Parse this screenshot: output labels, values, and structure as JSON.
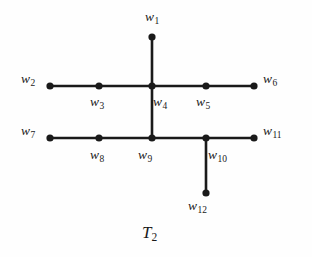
{
  "figure": {
    "caption_base": "T",
    "caption_sub": "2",
    "caption_full": "T2",
    "background_color": "#fefefe",
    "stroke_color": "#1a1a1a",
    "node_fill_color": "#1a1a1a",
    "edge_width_px": 2.6,
    "node_radius_px": 3.6,
    "caption_x": 142,
    "caption_y": 224
  },
  "chart_data": {
    "type": "diagram",
    "title": "T2",
    "node_count": 12,
    "edge_count": 11,
    "nodes": [
      {
        "id": "w1",
        "base": "w",
        "sub": "1",
        "label": "w1",
        "x": 152,
        "y": 37,
        "label_x": 145,
        "label_y": 10,
        "degree": 1
      },
      {
        "id": "w2",
        "base": "w",
        "sub": "2",
        "label": "w2",
        "x": 50,
        "y": 86,
        "label_x": 21,
        "label_y": 72,
        "degree": 1
      },
      {
        "id": "w3",
        "base": "w",
        "sub": "3",
        "label": "w3",
        "x": 99,
        "y": 86,
        "label_x": 90,
        "label_y": 95,
        "degree": 2
      },
      {
        "id": "w4",
        "base": "w",
        "sub": "4",
        "label": "w4",
        "x": 152,
        "y": 86,
        "label_x": 153,
        "label_y": 95,
        "degree": 4
      },
      {
        "id": "w5",
        "base": "w",
        "sub": "5",
        "label": "w5",
        "x": 206,
        "y": 86,
        "label_x": 196,
        "label_y": 95,
        "degree": 2
      },
      {
        "id": "w6",
        "base": "w",
        "sub": "6",
        "label": "w6",
        "x": 254,
        "y": 86,
        "label_x": 263,
        "label_y": 72,
        "degree": 1
      },
      {
        "id": "w7",
        "base": "w",
        "sub": "7",
        "label": "w7",
        "x": 50,
        "y": 138,
        "label_x": 21,
        "label_y": 124,
        "degree": 1
      },
      {
        "id": "w8",
        "base": "w",
        "sub": "8",
        "label": "w8",
        "x": 99,
        "y": 138,
        "label_x": 90,
        "label_y": 148,
        "degree": 2
      },
      {
        "id": "w9",
        "base": "w",
        "sub": "9",
        "label": "w9",
        "x": 152,
        "y": 138,
        "label_x": 138,
        "label_y": 148,
        "degree": 3
      },
      {
        "id": "w10",
        "base": "w",
        "sub": "10",
        "label": "w10",
        "x": 206,
        "y": 138,
        "label_x": 208,
        "label_y": 148,
        "degree": 3
      },
      {
        "id": "w11",
        "base": "w",
        "sub": "11",
        "label": "w11",
        "x": 254,
        "y": 138,
        "label_x": 263,
        "label_y": 124,
        "degree": 1
      },
      {
        "id": "w12",
        "base": "w",
        "sub": "12",
        "label": "w12",
        "x": 206,
        "y": 193,
        "label_x": 188,
        "label_y": 199,
        "degree": 1
      }
    ],
    "edges": [
      {
        "from": "w1",
        "to": "w4",
        "x1": 152,
        "y1": 37,
        "x2": 152,
        "y2": 86,
        "orientation": "vertical"
      },
      {
        "from": "w2",
        "to": "w3",
        "x1": 50,
        "y1": 86,
        "x2": 99,
        "y2": 86,
        "orientation": "horizontal"
      },
      {
        "from": "w3",
        "to": "w4",
        "x1": 99,
        "y1": 86,
        "x2": 152,
        "y2": 86,
        "orientation": "horizontal"
      },
      {
        "from": "w4",
        "to": "w5",
        "x1": 152,
        "y1": 86,
        "x2": 206,
        "y2": 86,
        "orientation": "horizontal"
      },
      {
        "from": "w5",
        "to": "w6",
        "x1": 206,
        "y1": 86,
        "x2": 254,
        "y2": 86,
        "orientation": "horizontal"
      },
      {
        "from": "w4",
        "to": "w9",
        "x1": 152,
        "y1": 86,
        "x2": 152,
        "y2": 138,
        "orientation": "vertical"
      },
      {
        "from": "w7",
        "to": "w8",
        "x1": 50,
        "y1": 138,
        "x2": 99,
        "y2": 138,
        "orientation": "horizontal"
      },
      {
        "from": "w8",
        "to": "w9",
        "x1": 99,
        "y1": 138,
        "x2": 152,
        "y2": 138,
        "orientation": "horizontal"
      },
      {
        "from": "w9",
        "to": "w10",
        "x1": 152,
        "y1": 138,
        "x2": 206,
        "y2": 138,
        "orientation": "horizontal"
      },
      {
        "from": "w10",
        "to": "w11",
        "x1": 206,
        "y1": 138,
        "x2": 254,
        "y2": 138,
        "orientation": "horizontal"
      },
      {
        "from": "w10",
        "to": "w12",
        "x1": 206,
        "y1": 138,
        "x2": 206,
        "y2": 193,
        "orientation": "vertical"
      }
    ],
    "xlabel": "",
    "ylabel": "",
    "grid": false,
    "legend": null
  }
}
